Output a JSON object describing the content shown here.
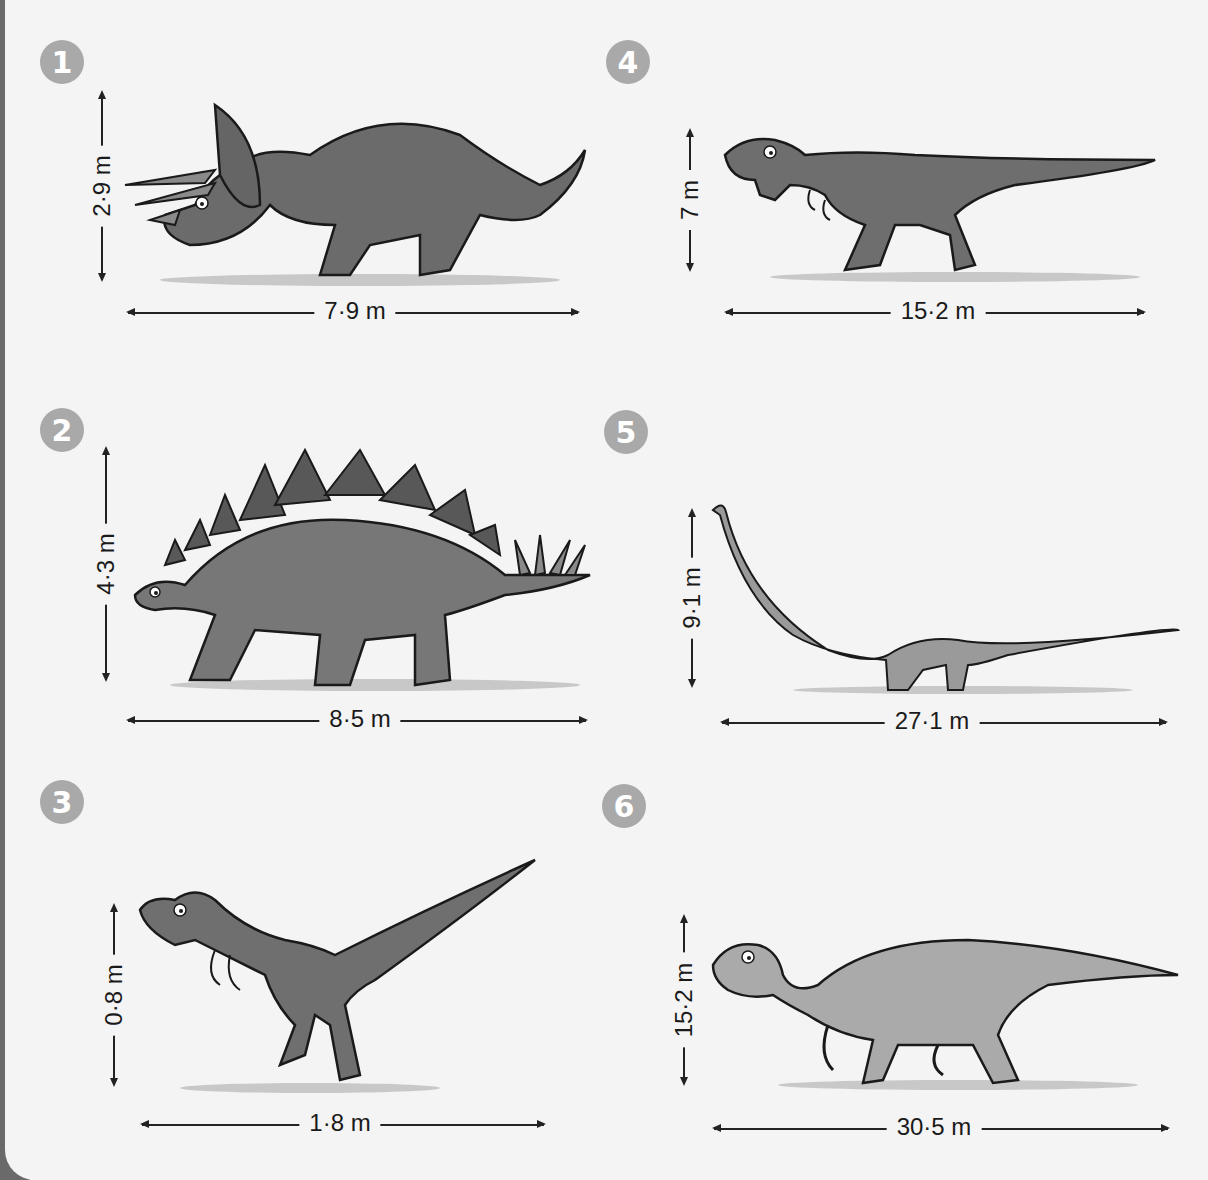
{
  "colors": {
    "background": "#f4f4f4",
    "badge": "#a9a9a9",
    "badge_text": "#ffffff",
    "arrow": "#222222",
    "dark_dino": "#6b6b6b",
    "mid_dino": "#8a8a8a",
    "light_dino": "#b0b0b0"
  },
  "panels": [
    {
      "number": "1",
      "dinosaur": "triceratops-like",
      "height_label": "2·9 m",
      "length_label": "7·9 m"
    },
    {
      "number": "2",
      "dinosaur": "stegosaurus-like",
      "height_label": "4·3 m",
      "length_label": "8·5 m"
    },
    {
      "number": "3",
      "dinosaur": "velociraptor-like",
      "height_label": "0·8 m",
      "length_label": "1·8 m"
    },
    {
      "number": "4",
      "dinosaur": "tyrannosaurus-like",
      "height_label": "7 m",
      "length_label": "15·2 m"
    },
    {
      "number": "5",
      "dinosaur": "diplodocus-like",
      "height_label": "9·1 m",
      "length_label": "27·1 m"
    },
    {
      "number": "6",
      "dinosaur": "iguanodon-like",
      "height_label": "15·2 m",
      "length_label": "30·5 m"
    }
  ]
}
